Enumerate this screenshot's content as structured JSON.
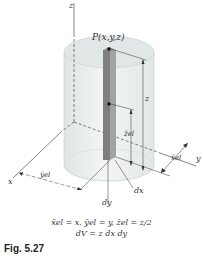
{
  "figure": {
    "caption": "Fig. 5.27",
    "point_label": "P(x,y,z)",
    "axes": {
      "x": "x",
      "y": "y",
      "z": "z"
    },
    "dimensions": {
      "z": "z",
      "z_el": "z̄el",
      "x_el": "x̄el",
      "y_el": "ȳel",
      "dx": "dx",
      "dy": "dy"
    },
    "equations": {
      "line1": "x̄el = x,  ȳel = y,  z̄el = z/2",
      "line2": "dV = z dx dy"
    },
    "colors": {
      "cylinder_fill": "#e9ecec",
      "cylinder_top": "#dfe3e3",
      "element_bar": "#8a8a8a",
      "element_bar_side": "#a4a4a4",
      "line": "#333333"
    }
  }
}
